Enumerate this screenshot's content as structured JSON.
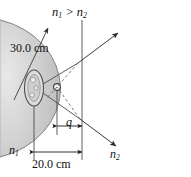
{
  "figure": {
    "background_color": "#ffffff",
    "medium_fill_color": "#c9c9c9",
    "line_color": "#3a3a3a",
    "text_color": "#111111"
  },
  "labels": {
    "index_relation": "n1 > n2",
    "index_relation_parts": {
      "first": "n",
      "first_sub": "1",
      "operator": " > ",
      "second": "n",
      "second_sub": "2"
    },
    "radius": "30.0 cm",
    "object_distance": "20.0 cm",
    "image_distance": "q",
    "medium_left": "n1",
    "medium_left_parts": {
      "symbol": "n",
      "sub": "1"
    },
    "medium_right": "n2",
    "medium_right_parts": {
      "symbol": "n",
      "sub": "2"
    }
  },
  "elements": {
    "dome": {
      "name": "refracting-medium-dome",
      "description": "shaded semicircular medium bulging to the right",
      "center_x": 0,
      "center_y": 86,
      "radius_px": 82
    },
    "object": {
      "name": "object-fish",
      "description": "oval object on a vertical stem inside the dense medium",
      "x": 34,
      "y": 88
    },
    "image_point": {
      "name": "image-point",
      "description": "small open circle where refracted rays appear to originate",
      "x": 57,
      "y": 87
    },
    "eye_photo": {
      "name": "observer-eye-photograph",
      "description": "grayscale photograph of a human eye viewing from the right",
      "x": 108,
      "y": 52,
      "width": 80,
      "height": 86
    },
    "rays": [
      {
        "name": "ray-upper-refracted",
        "direction": "up-right",
        "style": "solid-arrow"
      },
      {
        "name": "ray-lower-refracted",
        "direction": "down-right",
        "style": "solid-arrow"
      },
      {
        "name": "ray-virtual-extension-upper",
        "direction": "to-image-point",
        "style": "dashed"
      },
      {
        "name": "ray-virtual-extension-lower",
        "direction": "to-image-point",
        "style": "dashed"
      },
      {
        "name": "radius-arrow",
        "direction": "up-right",
        "style": "solid-arrow"
      }
    ],
    "dimensions": [
      {
        "name": "dimension-object-distance",
        "label": "20.0 cm",
        "from_x": 34,
        "to_x": 82,
        "y": 152
      },
      {
        "name": "dimension-image-distance",
        "label": "q",
        "from_x": 57,
        "to_x": 82,
        "y": 126
      },
      {
        "name": "dimension-radius",
        "label": "30.0 cm",
        "style": "leader-arrow"
      }
    ],
    "guide_lines": [
      {
        "name": "axis-line-object",
        "x": 34,
        "y1": 88,
        "y2": 160
      },
      {
        "name": "axis-line-image",
        "x": 57,
        "y1": 87,
        "y2": 135
      },
      {
        "name": "axis-line-vertex",
        "x": 82,
        "y1": 20,
        "y2": 160
      }
    ]
  }
}
